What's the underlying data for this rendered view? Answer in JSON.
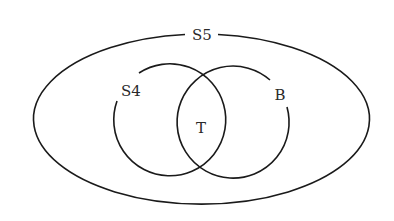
{
  "diagram": {
    "type": "venn",
    "sets": [
      {
        "id": "outer",
        "label": "S5"
      },
      {
        "id": "left",
        "label": "S4"
      },
      {
        "id": "right",
        "label": "B"
      }
    ],
    "intersection_label": "T"
  },
  "colors": {
    "stroke": "#1a1a1a",
    "background": "#ffffff",
    "text": "#2a2a2a"
  }
}
